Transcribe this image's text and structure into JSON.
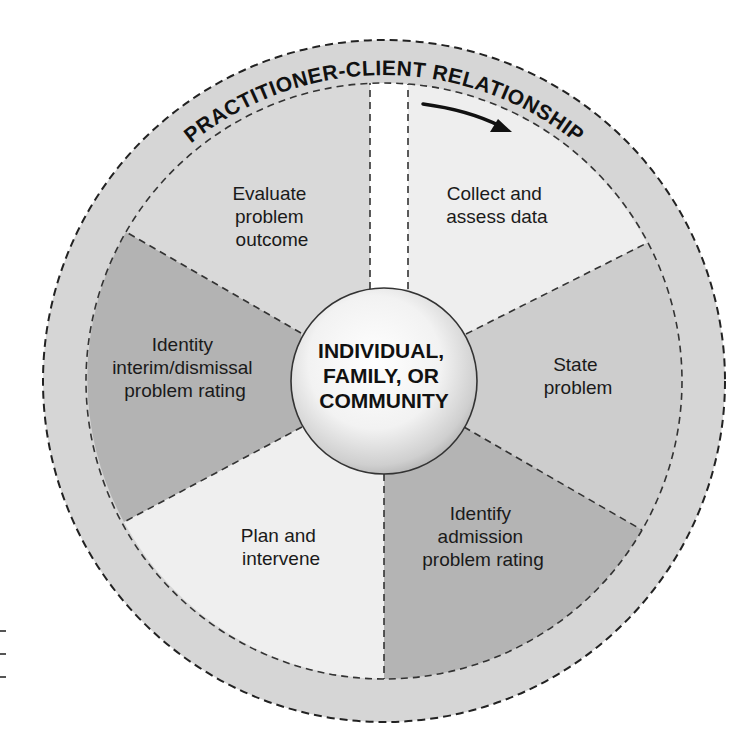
{
  "ring": {
    "label": "PRACTITIONER-CLIENT RELATIONSHIP",
    "fill": "#d6d6d6",
    "direction_arrow": "clockwise-arrow"
  },
  "center": {
    "line1": "INDIVIDUAL,",
    "line2": "FAMILY, OR",
    "line3": "COMMUNITY"
  },
  "segments": [
    {
      "id": "collect",
      "lines": [
        "Collect and",
        "assess data"
      ],
      "fill": "#eeeeee"
    },
    {
      "id": "state",
      "lines": [
        "State",
        "problem"
      ],
      "fill": "#cdcdcd"
    },
    {
      "id": "identify-admission",
      "lines": [
        "Identify",
        "admission",
        "problem rating"
      ],
      "fill": "#b4b4b4"
    },
    {
      "id": "plan",
      "lines": [
        "Plan and",
        "intervene"
      ],
      "fill": "#efefef"
    },
    {
      "id": "identify-interim",
      "lines": [
        "Identity",
        "interim/dismissal",
        "problem rating"
      ],
      "fill": "#b3b3b3"
    },
    {
      "id": "evaluate",
      "lines": [
        "Evaluate",
        "problem",
        "outcome"
      ],
      "fill": "#d9d9d9"
    }
  ],
  "colors": {
    "background": "#ffffff",
    "gap": "#ffffff",
    "stroke": "#222222"
  }
}
